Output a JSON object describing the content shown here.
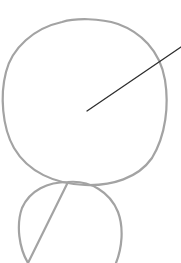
{
  "diagram": {
    "shapes": [
      {
        "id": "upper-circle",
        "kind": "circle",
        "role": "large circle"
      },
      {
        "id": "lower-circle",
        "kind": "circle",
        "role": "small circle, tangent below the large circle"
      },
      {
        "id": "radius-line",
        "kind": "line",
        "role": "line from center of large circle extending past its edge to upper-right"
      }
    ],
    "colors": {
      "circle_stroke": "#a3a3a3",
      "line_stroke": "#2e2e2e",
      "background": "#ffffff"
    }
  }
}
